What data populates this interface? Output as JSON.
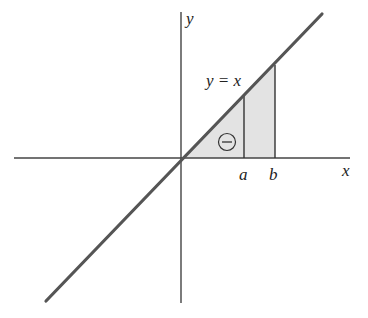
{
  "diagram": {
    "type": "integral-area-illustration",
    "axes": {
      "x_label": "x",
      "y_label": "y"
    },
    "line": {
      "label": "y = x",
      "color": "#555555"
    },
    "points": {
      "a_label": "a",
      "b_label": "b"
    },
    "shaded_region": {
      "fill": "#e3e3e3",
      "sign_symbol": "minus-in-circle",
      "sign_glyph": "−"
    },
    "colors": {
      "axis": "#444444",
      "stroke": "#333333"
    }
  }
}
